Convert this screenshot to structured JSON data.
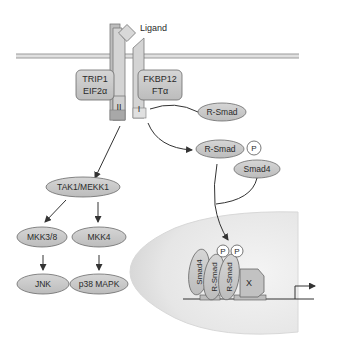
{
  "diagram": {
    "ligand": "Ligand",
    "receptor_II": {
      "label": "II",
      "partners_line1": "TRIP1",
      "partners_line2": "EIF2α"
    },
    "receptor_I": {
      "label": "I",
      "partners_line1": "FKBP12",
      "partners_line2": "FTα"
    },
    "rsmad": "R-Smad",
    "rsmad_p": "R-Smad",
    "phospho": "P",
    "smad4": "Smad4",
    "mapk_pathway": {
      "tak1": "TAK1/MEKK1",
      "mkk38": "MKK3/8",
      "mkk4": "MKK4",
      "jnk": "JNK",
      "p38": "p38 MAPK"
    },
    "nucleus_complex": {
      "smad4": "Smad4",
      "rsmad1": "R-Smad",
      "rsmad2": "R-Smad",
      "p1": "P",
      "p2": "P",
      "x": "X"
    },
    "colors": {
      "oval_fill": "#c8c8c8",
      "oval_stroke": "#6a6a6a",
      "receptor_fill": "#d4d4d4",
      "receptor_dark": "#a8a8a8",
      "membrane": "#9a9a9a",
      "nucleus": "#e6e6e6",
      "arrow": "#333333"
    }
  }
}
